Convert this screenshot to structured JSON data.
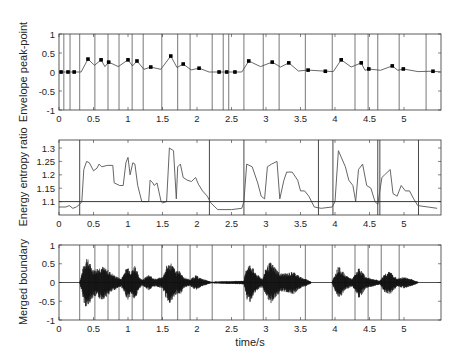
{
  "figure": {
    "xlabel": "time/s",
    "boundaries_s": [
      0.07,
      0.16,
      0.3,
      0.52,
      0.71,
      0.87,
      1.06,
      1.22,
      1.49,
      1.72,
      1.9,
      2.22,
      2.38,
      2.46,
      2.68,
      2.96,
      3.19,
      3.57,
      3.96,
      4.29,
      4.48,
      4.62,
      4.93,
      5.32
    ],
    "merged_boundaries_s": [
      0.3,
      0.52,
      0.71,
      0.87,
      1.06,
      1.22,
      1.49,
      1.72,
      1.9,
      2.22,
      2.68,
      2.96,
      3.19,
      3.57,
      3.96,
      4.29,
      4.48,
      4.67,
      4.93
    ]
  },
  "chart_data": [
    {
      "type": "line",
      "title": "",
      "ylabel": "Envelope peak-point",
      "xlabel": "",
      "xlim": [
        0,
        5.53
      ],
      "ylim": [
        -1,
        1
      ],
      "xticks": [
        "0",
        "0.5",
        "1",
        "1.5",
        "2",
        "2.5",
        "3",
        "3.5",
        "4",
        "4.5",
        "5"
      ],
      "yticks": [
        "-1",
        "-0.5",
        "0",
        "0.5",
        "1"
      ],
      "grid": false,
      "peak_points": {
        "x": [
          0.03,
          0.13,
          0.22,
          0.42,
          0.61,
          0.72,
          1.0,
          1.13,
          1.33,
          1.62,
          1.8,
          2.03,
          2.32,
          2.43,
          2.55,
          2.75,
          3.09,
          3.33,
          3.61,
          3.86,
          4.09,
          4.38,
          4.49,
          4.83,
          4.99,
          5.42
        ],
        "y": [
          0.0,
          0.0,
          0.0,
          0.34,
          0.32,
          0.26,
          0.32,
          0.29,
          0.13,
          0.42,
          0.21,
          0.1,
          0.0,
          0.0,
          0.0,
          0.29,
          0.26,
          0.24,
          0.05,
          0.02,
          0.32,
          0.24,
          0.08,
          0.16,
          0.08,
          0.02
        ]
      },
      "vertical_lines_s": "figure.boundaries_s"
    },
    {
      "type": "line",
      "title": "",
      "ylabel": "Energy entropy ratio",
      "xlabel": "",
      "xlim": [
        0,
        5.53
      ],
      "ylim": [
        1.05,
        1.33
      ],
      "xticks": [
        "0",
        "0.5",
        "1",
        "1.5",
        "2",
        "2.5",
        "3",
        "3.5",
        "4",
        "4.5",
        "5"
      ],
      "yticks": [
        "1.1",
        "1.15",
        "1.2",
        "1.25",
        "1.3"
      ],
      "threshold": 1.1,
      "series": [
        {
          "name": "energy entropy ratio",
          "x": [
            0,
            0.1,
            0.15,
            0.2,
            0.25,
            0.3,
            0.33,
            0.36,
            0.4,
            0.44,
            0.5,
            0.55,
            0.58,
            0.62,
            0.7,
            0.78,
            0.8,
            0.88,
            0.93,
            0.97,
            1.0,
            1.03,
            1.07,
            1.1,
            1.14,
            1.2,
            1.26,
            1.3,
            1.32,
            1.36,
            1.38,
            1.42,
            1.48,
            1.5,
            1.56,
            1.6,
            1.66,
            1.7,
            1.72,
            1.76,
            1.8,
            1.86,
            1.92,
            1.98,
            2.02,
            2.08,
            2.15,
            2.2,
            2.3,
            2.5,
            2.65,
            2.68,
            2.72,
            2.8,
            2.88,
            2.93,
            2.98,
            3.02,
            3.08,
            3.16,
            3.2,
            3.26,
            3.3,
            3.38,
            3.46,
            3.5,
            3.56,
            3.62,
            3.7,
            3.8,
            3.96,
            4.0,
            4.05,
            4.15,
            4.2,
            4.26,
            4.3,
            4.34,
            4.4,
            4.46,
            4.52,
            4.58,
            4.62,
            4.68,
            4.72,
            4.8,
            4.84,
            4.9,
            4.96,
            5.02,
            5.08,
            5.14,
            5.2,
            5.35,
            5.48
          ],
          "y": [
            1.08,
            1.08,
            1.085,
            1.075,
            1.08,
            1.09,
            1.1,
            1.22,
            1.25,
            1.245,
            1.215,
            1.225,
            1.24,
            1.23,
            1.235,
            1.235,
            1.17,
            1.16,
            1.16,
            1.245,
            1.265,
            1.2,
            1.245,
            1.24,
            1.16,
            1.1,
            1.1,
            1.1,
            1.18,
            1.17,
            1.16,
            1.17,
            1.1,
            1.095,
            1.1,
            1.3,
            1.29,
            1.11,
            1.23,
            1.24,
            1.19,
            1.18,
            1.175,
            1.19,
            1.165,
            1.14,
            1.12,
            1.095,
            1.07,
            1.07,
            1.075,
            1.1,
            1.24,
            1.23,
            1.17,
            1.12,
            1.11,
            1.23,
            1.24,
            1.25,
            1.11,
            1.18,
            1.21,
            1.21,
            1.18,
            1.14,
            1.14,
            1.12,
            1.08,
            1.075,
            1.08,
            1.1,
            1.29,
            1.23,
            1.18,
            1.16,
            1.1,
            1.22,
            1.24,
            1.16,
            1.15,
            1.1,
            1.09,
            1.19,
            1.2,
            1.22,
            1.13,
            1.12,
            1.16,
            1.14,
            1.14,
            1.11,
            1.085,
            1.08,
            1.075
          ]
        }
      ],
      "vertical_lines_s": [
        0.3,
        2.18,
        2.68,
        3.76,
        3.97,
        4.62,
        4.65,
        5.21
      ]
    },
    {
      "type": "line",
      "title": "",
      "ylabel": "Merged boundary",
      "xlabel": "time/s",
      "xlim": [
        0,
        5.53
      ],
      "ylim": [
        -1,
        1
      ],
      "xticks": [
        "0",
        "0.5",
        "1",
        "1.5",
        "2",
        "2.5",
        "3",
        "3.5",
        "4",
        "4.5",
        "5"
      ],
      "yticks": [
        "-1",
        "-0.5",
        "0",
        "0.5",
        "1"
      ],
      "waveform_envelope": {
        "x": [
          0.3,
          0.36,
          0.4,
          0.44,
          0.5,
          0.56,
          0.62,
          0.7,
          0.8,
          0.9,
          0.95,
          1.0,
          1.05,
          1.1,
          1.15,
          1.2,
          1.3,
          1.4,
          1.5,
          1.56,
          1.62,
          1.7,
          1.75,
          1.8,
          1.9,
          1.98,
          2.05,
          2.2,
          2.68,
          2.72,
          2.78,
          2.85,
          2.95,
          3.0,
          3.06,
          3.12,
          3.2,
          3.3,
          3.4,
          3.5,
          3.6,
          3.65,
          3.96,
          4.05,
          4.15,
          4.25,
          4.35,
          4.45,
          4.55,
          4.65,
          4.72,
          4.8,
          4.9,
          5.0,
          5.1,
          5.2
        ],
        "amp": [
          0.02,
          0.5,
          0.7,
          0.55,
          0.35,
          0.4,
          0.45,
          0.35,
          0.2,
          0.1,
          0.3,
          0.45,
          0.3,
          0.5,
          0.2,
          0.08,
          0.2,
          0.1,
          0.15,
          0.45,
          0.55,
          0.3,
          0.35,
          0.15,
          0.08,
          0.2,
          0.12,
          0.02,
          0.05,
          0.45,
          0.5,
          0.25,
          0.1,
          0.4,
          0.55,
          0.45,
          0.25,
          0.25,
          0.3,
          0.15,
          0.08,
          0.03,
          0.03,
          0.45,
          0.2,
          0.1,
          0.4,
          0.15,
          0.1,
          0.05,
          0.25,
          0.3,
          0.1,
          0.15,
          0.1,
          0.02
        ]
      },
      "vertical_lines_s": "figure.merged_boundaries_s"
    }
  ]
}
